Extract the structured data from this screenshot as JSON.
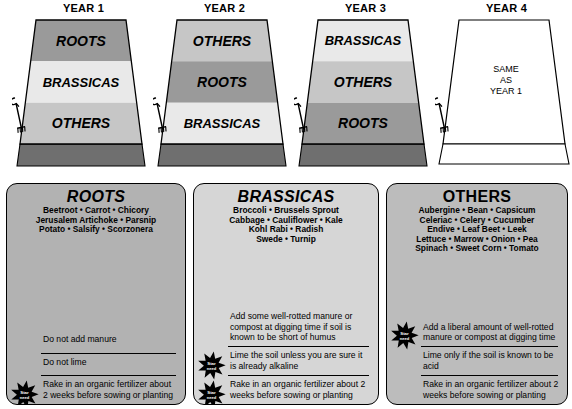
{
  "diagram": {
    "colors": {
      "roots_band": "#9a9a9a",
      "brassicas_band": "#e9e9e9",
      "others_band": "#c6c6c6",
      "plot_side": "#7d7d7d",
      "plot_front": "#6f6f6f",
      "outline": "#000000",
      "panel_roots_bg": "#b2b2b2",
      "panel_brassicas_bg": "#d6d6d6",
      "panel_others_bg": "#bcbcbc",
      "empty_plot": "#ffffff"
    },
    "plots": [
      {
        "title": "YEAR 1",
        "empty": false,
        "bands": [
          {
            "label": "ROOTS",
            "crop": "roots"
          },
          {
            "label": "BRASSICAS",
            "crop": "brassicas"
          },
          {
            "label": "OTHERS",
            "crop": "others"
          }
        ]
      },
      {
        "title": "YEAR 2",
        "empty": false,
        "bands": [
          {
            "label": "OTHERS",
            "crop": "others"
          },
          {
            "label": "ROOTS",
            "crop": "roots"
          },
          {
            "label": "BRASSICAS",
            "crop": "brassicas"
          }
        ]
      },
      {
        "title": "YEAR 3",
        "empty": false,
        "bands": [
          {
            "label": "BRASSICAS",
            "crop": "brassicas"
          },
          {
            "label": "OTHERS",
            "crop": "others"
          },
          {
            "label": "ROOTS",
            "crop": "roots"
          }
        ]
      },
      {
        "title": "YEAR 4",
        "empty": true,
        "empty_text": [
          "SAME",
          "AS",
          "YEAR 1"
        ],
        "bands": []
      }
    ]
  },
  "star_badge": {
    "line1": "Star",
    "line2": "need"
  },
  "panels": [
    {
      "id": "roots",
      "title": "ROOTS",
      "title_italic": true,
      "vegetables": [
        "Beetroot • Carrot • Chicory",
        "Jerusalem Artichoke • Parsnip",
        "Potato • Salsify • Scorzonera"
      ],
      "rules": [
        {
          "text": "Do not add manure",
          "star": false,
          "divider": false
        },
        {
          "text": "Do not lime",
          "star": false,
          "divider": true
        },
        {
          "text": "Rake in an organic fertilizer about 2 weeks before sowing or planting",
          "star": true,
          "divider": true
        }
      ]
    },
    {
      "id": "brassicas",
      "title": "BRASSICAS",
      "title_italic": true,
      "vegetables": [
        "Broccoli • Brussels Sprout",
        "Cabbage • Cauliflower • Kale",
        "Kohl Rabi • Radish",
        "Swede • Turnip"
      ],
      "rules": [
        {
          "text": "Add some well-rotted manure or compost at digging time if soil is known to be short of humus",
          "star": false,
          "divider": false
        },
        {
          "text": "Lime the soil unless you are sure it is already alkaline",
          "star": true,
          "divider": true
        },
        {
          "text": "Rake in an organic fertilizer about 2 weeks before sowing or planting",
          "star": true,
          "divider": true
        }
      ]
    },
    {
      "id": "others",
      "title": "OTHERS",
      "title_italic": false,
      "vegetables": [
        "Aubergine • Bean • Capsicum",
        "Celeriac • Celery • Cucumber",
        "Endive • Leaf Beet • Leek",
        "Lettuce • Marrow • Onion • Pea",
        "Spinach • Sweet Corn • Tomato"
      ],
      "rules": [
        {
          "text": "Add a liberal amount of well-rotted manure or compost at digging time",
          "star": true,
          "divider": false
        },
        {
          "text": "Lime only if the soil is known to be acid",
          "star": false,
          "divider": true
        },
        {
          "text": "Rake in an organic fertilizer about 2 weeks before sowing or planting",
          "star": false,
          "divider": true
        }
      ]
    }
  ]
}
